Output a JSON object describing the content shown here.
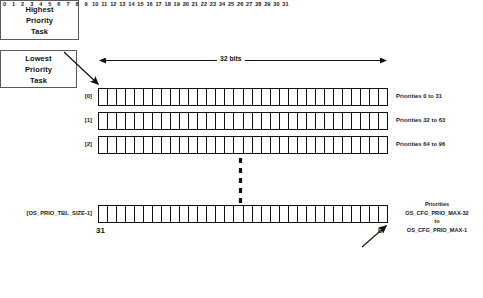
{
  "diagram": {
    "bits_measure_label": "32 bits",
    "bit_count": 32,
    "bit_ticks": [
      "0",
      "1",
      "2",
      "3",
      "4",
      "5",
      "6",
      "7",
      "8",
      "9",
      "10",
      "11",
      "12",
      "13",
      "14",
      "15",
      "16",
      "17",
      "18",
      "19",
      "20",
      "21",
      "22",
      "23",
      "24",
      "25",
      "26",
      "27",
      "28",
      "29",
      "30",
      "31"
    ],
    "callouts": {
      "highest": {
        "lines": [
          "Highest",
          "Priority",
          "Task"
        ]
      },
      "lowest": {
        "lines": [
          "Lowest",
          "Priority",
          "Task"
        ]
      }
    },
    "rows": [
      {
        "index_label": "[0]",
        "priority_label": "Priorities 0 to 31",
        "cells": 32
      },
      {
        "index_label": "[1]",
        "priority_label": "Priorities 32 to 63",
        "cells": 32
      },
      {
        "index_label": "[2]",
        "priority_label": "Priorities 64 to 96",
        "cells": 32
      }
    ],
    "last_row": {
      "index_label": "[OS_PRIO_TBL_SIZE-1]",
      "cells": 32,
      "priority_label_lines": [
        "Priorities",
        "OS_CFG_PRIO_MAX-32",
        "to",
        "OS_CFG_PRIO_MAX-1"
      ],
      "left_bit_number": "31",
      "right_bit_number": "0"
    },
    "colors": {
      "stroke": "#111111",
      "box_border": "#5a5a5a",
      "background": "#ffffff",
      "text": "#111111"
    }
  }
}
